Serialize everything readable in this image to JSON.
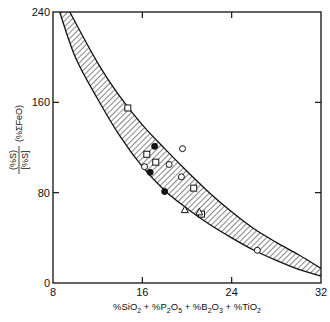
{
  "chart_data": {
    "type": "scatter",
    "title": "",
    "xlabel": "%SiO2 + %P2O5 + %B2O3 + %TiO2",
    "ylabel": "(%S)/[%S] (%ΣFeO)",
    "xlim": [
      8,
      32
    ],
    "ylim": [
      0,
      240
    ],
    "x_ticks": [
      8,
      16,
      24,
      32
    ],
    "y_ticks": [
      0,
      80,
      160,
      240
    ],
    "grid": false,
    "legend": null,
    "band": {
      "description": "hatched band enclosing data",
      "upper": [
        [
          9.5,
          240
        ],
        [
          12,
          195
        ],
        [
          14,
          165
        ],
        [
          16,
          140
        ],
        [
          18,
          119
        ],
        [
          20,
          99
        ],
        [
          22,
          80
        ],
        [
          24,
          63
        ],
        [
          26,
          48
        ],
        [
          28,
          36
        ],
        [
          30,
          25
        ],
        [
          32,
          13
        ]
      ],
      "lower": [
        [
          8.6,
          240
        ],
        [
          10,
          200
        ],
        [
          12,
          163
        ],
        [
          14,
          130
        ],
        [
          16,
          103
        ],
        [
          18,
          82
        ],
        [
          20,
          66
        ],
        [
          22,
          52
        ],
        [
          24,
          40
        ],
        [
          26,
          29
        ],
        [
          28,
          20
        ],
        [
          30,
          12
        ],
        [
          32,
          6
        ]
      ]
    },
    "series": [
      {
        "name": "open-square",
        "marker": "square",
        "filled": false,
        "points": [
          [
            14.7,
            155
          ],
          [
            16.4,
            114
          ],
          [
            17.2,
            107
          ],
          [
            20.6,
            84
          ],
          [
            21.3,
            61
          ]
        ]
      },
      {
        "name": "filled-circle",
        "marker": "circle",
        "filled": true,
        "points": [
          [
            17.1,
            121
          ],
          [
            16.7,
            98
          ],
          [
            18.0,
            81
          ]
        ]
      },
      {
        "name": "open-circle",
        "marker": "circle",
        "filled": false,
        "points": [
          [
            19.6,
            119
          ],
          [
            18.4,
            105
          ],
          [
            16.2,
            103
          ],
          [
            19.5,
            94
          ],
          [
            26.3,
            29
          ]
        ]
      },
      {
        "name": "open-triangle",
        "marker": "triangle",
        "filled": false,
        "points": [
          [
            19.8,
            65
          ],
          [
            21.1,
            63
          ]
        ]
      }
    ]
  },
  "axes": {
    "x_tick_labels": [
      "8",
      "16",
      "24",
      "32"
    ],
    "y_tick_labels": [
      "0",
      "80",
      "160",
      "240"
    ],
    "xlabel_parts": {
      "p1": "%SiO",
      "s1": "2",
      "p2": " + %P",
      "s2": "2",
      "p3": "O",
      "s3": "5",
      "p4": " + %B",
      "s4": "2",
      "p5": "O",
      "s5": "3",
      "p6": " + %TiO",
      "s6": "2"
    },
    "ylabel_num": "(%S)",
    "ylabel_den": "[%S]",
    "ylabel_suffix": "(%ΣFeO)"
  },
  "colors": {
    "ink": "#111111",
    "background": "#ffffff"
  }
}
